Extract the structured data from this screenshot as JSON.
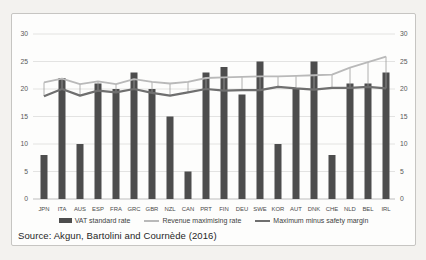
{
  "page": {
    "background": "#f3f2ef"
  },
  "chart_data": {
    "type": "bar",
    "subtype": "combo bar + two line series with high-low connector lines",
    "title": "",
    "xlabel": "",
    "ylabel": "",
    "categories": [
      "JPN",
      "ITA",
      "AUS",
      "ESP",
      "FRA",
      "GRC",
      "GBR",
      "NZL",
      "CAN",
      "PRT",
      "FIN",
      "DEU",
      "SWE",
      "KOR",
      "AUT",
      "DNK",
      "CHE",
      "NLD",
      "BEL",
      "IRL"
    ],
    "series": [
      {
        "name": "VAT standard rate",
        "type": "bar",
        "color": "#4d4d4d",
        "values": [
          8,
          22,
          10,
          21,
          20,
          23,
          20,
          15,
          5,
          23,
          24,
          19,
          25,
          10,
          20,
          25,
          8,
          21,
          21,
          23
        ]
      },
      {
        "name": "Revenue maximising rate",
        "type": "line",
        "color": "#b9b9b9",
        "values": [
          21.2,
          21.9,
          20.9,
          21.4,
          20.9,
          21.8,
          21.3,
          21.0,
          21.3,
          22.0,
          22.1,
          22.2,
          22.3,
          22.3,
          22.4,
          22.5,
          22.6,
          23.9,
          24.9,
          25.9
        ]
      },
      {
        "name": "Maximum minus safety margin",
        "type": "line",
        "color": "#6f6f6f",
        "values": [
          18.7,
          20.0,
          18.8,
          19.7,
          19.4,
          20.0,
          19.3,
          18.8,
          19.4,
          20.0,
          19.7,
          19.8,
          19.8,
          20.4,
          20.1,
          19.9,
          20.2,
          20.2,
          20.4,
          20.1
        ]
      }
    ],
    "high_low_lines": true,
    "high_low_color": "#9c9c9c",
    "y_axis": {
      "min": 0,
      "max": 30,
      "step": 5,
      "ticks": [
        0,
        5,
        10,
        15,
        20,
        25,
        30
      ],
      "sides": [
        "left",
        "right"
      ]
    },
    "gridline_color": "#dcdcda",
    "zero_line_color": "#bdbdbd",
    "tick_label_color": "#595959",
    "category_label_color": "#4a4a4a",
    "legend_position": "bottom",
    "source": "Source: Akgun, Bartolini and Cournède (2016)"
  },
  "legend": {
    "items": [
      {
        "label": "VAT standard rate",
        "swatch": "bar-swatch",
        "color": "#4d4d4d"
      },
      {
        "label": "Revenue maximising rate",
        "swatch": "line-swatch",
        "color": "#b9b9b9",
        "thickness": 2
      },
      {
        "label": "Maximum minus safety margin",
        "swatch": "line-swatch",
        "color": "#6f6f6f",
        "thickness": 2.5
      }
    ]
  },
  "source_text": "Source: Akgun, Bartolini and Cournède (2016)"
}
